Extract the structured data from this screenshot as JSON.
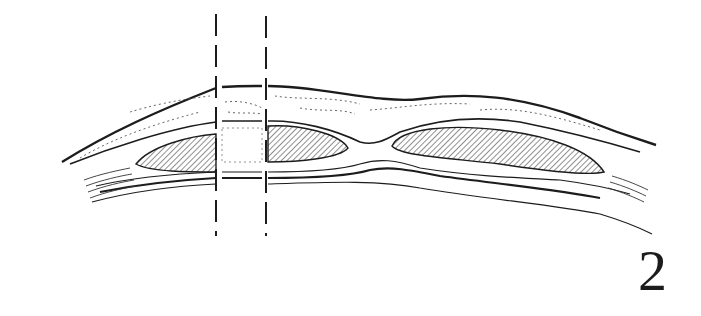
{
  "figure": {
    "number_label": "2",
    "colors": {
      "line": "#1c1c1c",
      "background": "#ffffff",
      "hatch": "#333333"
    },
    "dashed_lines": [
      {
        "x": 216,
        "y_top": 14,
        "y_bottom": 236
      },
      {
        "x": 266,
        "y_top": 16,
        "y_bottom": 236
      }
    ]
  }
}
